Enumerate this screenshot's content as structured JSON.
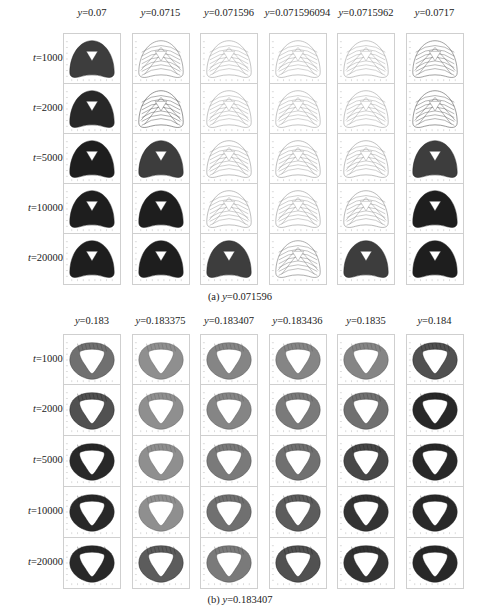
{
  "parts": [
    {
      "id": "a",
      "caption_prefix": "(a) ",
      "caption_var": "y",
      "caption_eq": "=0.071596",
      "row_label_var": "t",
      "columns": [
        "=0.07",
        "=0.0715",
        "=0.071596",
        "=0.071596094",
        "=0.0715962",
        "=0.0717"
      ],
      "rows": [
        "=1000",
        "=2000",
        "=5000",
        "=10000",
        "=20000"
      ]
    },
    {
      "id": "b",
      "caption_prefix": "(b) ",
      "caption_var": "y",
      "caption_eq": "=0.183407",
      "row_label_var": "t",
      "columns": [
        "=0.183",
        "=0.183375",
        "=0.183407",
        "=0.183436",
        "=0.1835",
        "=0.184"
      ],
      "rows": [
        "=1000",
        "=2000",
        "=5000",
        "=10000",
        "=20000"
      ]
    }
  ],
  "chart_data": [
    {
      "type": "heatmap",
      "title": "(a) y=0.071596",
      "description": "Grid of trajectory phase portraits (rounded-triangle / bell shape with triangular hole), shade indicates trajectory density",
      "x": [
        "y=0.07",
        "y=0.0715",
        "y=0.071596",
        "y=0.071596094",
        "y=0.0715962",
        "y=0.0717"
      ],
      "y": [
        "t=1000",
        "t=2000",
        "t=5000",
        "t=10000",
        "t=20000"
      ],
      "shape": "bell-triangle",
      "density": [
        [
          0.85,
          0.35,
          0.15,
          0.15,
          0.15,
          0.45
        ],
        [
          0.95,
          0.55,
          0.15,
          0.15,
          0.15,
          0.5
        ],
        [
          1.0,
          0.85,
          0.2,
          0.2,
          0.2,
          0.85
        ],
        [
          1.0,
          1.0,
          0.2,
          0.2,
          0.25,
          1.0
        ],
        [
          1.0,
          1.0,
          0.85,
          0.35,
          0.85,
          1.0
        ]
      ]
    },
    {
      "type": "heatmap",
      "title": "(b) y=0.183407",
      "description": "Grid of trajectory phase portraits (annular rounded-triangle ring), shade indicates trajectory density",
      "x": [
        "y=0.183",
        "y=0.183375",
        "y=0.183407",
        "y=0.183436",
        "y=0.1835",
        "y=0.184"
      ],
      "y": [
        "t=1000",
        "t=2000",
        "t=5000",
        "t=10000",
        "t=20000"
      ],
      "shape": "ring-triangle",
      "density": [
        [
          0.6,
          0.45,
          0.5,
          0.5,
          0.5,
          0.75
        ],
        [
          0.75,
          0.45,
          0.5,
          0.55,
          0.6,
          0.95
        ],
        [
          0.95,
          0.45,
          0.55,
          0.6,
          0.8,
          0.95
        ],
        [
          0.95,
          0.45,
          0.6,
          0.7,
          0.9,
          0.95
        ],
        [
          0.95,
          0.7,
          0.55,
          0.75,
          0.9,
          0.95
        ]
      ]
    }
  ]
}
